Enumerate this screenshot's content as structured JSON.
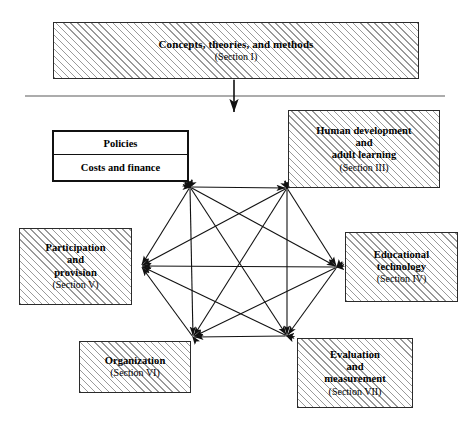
{
  "figure": {
    "type": "block-diagram"
  },
  "boxes": {
    "concepts": {
      "id": "concepts-theories-methods",
      "title": "Concepts, theories, and methods",
      "section": "(Section I)",
      "style": "hatched",
      "position": "top-banner"
    },
    "policies": {
      "id": "policies-costs-finance",
      "title": "Policies",
      "subtitle": "Costs and finance",
      "style": "plain-white",
      "position": "upper-left"
    },
    "human": {
      "id": "human-development-adult-learning",
      "line1": "Human development",
      "line2": "and",
      "line3": "adult learning",
      "section": "(Section III)",
      "style": "hatched",
      "position": "upper-right"
    },
    "participation": {
      "id": "participation-and-provision",
      "line1": "Participation",
      "line2": "and",
      "line3": "provision",
      "section": "(Section V)",
      "style": "hatched",
      "position": "left"
    },
    "edtech": {
      "id": "educational-technology",
      "line1": "Educational",
      "line2": "technology",
      "section": "(Section IV)",
      "style": "hatched",
      "position": "right"
    },
    "organization": {
      "id": "organization",
      "line1": "Organization",
      "section": "(Section VI)",
      "style": "hatched",
      "position": "bottom-left"
    },
    "evaluation": {
      "id": "evaluation-and-measurement",
      "line1": "Evaluation",
      "line2": "and",
      "line3": "measurement",
      "section": "(Section VII)",
      "style": "hatched",
      "position": "bottom-right"
    }
  },
  "divider": {
    "name": "horizontal-separator",
    "x1": 25,
    "y1": 96,
    "x2": 445,
    "y2": 96,
    "color": "#5a5a5a"
  },
  "vertical_connector": {
    "name": "bidirectional-vertical-arrow",
    "x": 234,
    "y_top": 79,
    "y_bottom": 113,
    "arrowheads": "both",
    "color": "#111111"
  },
  "network": {
    "name": "complete-graph-k6",
    "arrowheads": "both",
    "color": "#111111",
    "nodes": [
      {
        "id": "policies",
        "x": 190,
        "y": 187,
        "label": "Policies / Costs and finance"
      },
      {
        "id": "human",
        "x": 287,
        "y": 188,
        "label": "Human development and adult learning"
      },
      {
        "id": "edtech",
        "x": 337,
        "y": 267,
        "label": "Educational technology"
      },
      {
        "id": "evaluation",
        "x": 287,
        "y": 336,
        "label": "Evaluation and measurement"
      },
      {
        "id": "organization",
        "x": 193,
        "y": 337,
        "label": "Organization"
      },
      {
        "id": "participation",
        "x": 141,
        "y": 266,
        "label": "Participation and provision"
      }
    ],
    "edges": [
      [
        "policies",
        "human"
      ],
      [
        "policies",
        "edtech"
      ],
      [
        "policies",
        "evaluation"
      ],
      [
        "policies",
        "organization"
      ],
      [
        "policies",
        "participation"
      ],
      [
        "human",
        "edtech"
      ],
      [
        "human",
        "evaluation"
      ],
      [
        "human",
        "organization"
      ],
      [
        "human",
        "participation"
      ],
      [
        "edtech",
        "evaluation"
      ],
      [
        "edtech",
        "organization"
      ],
      [
        "edtech",
        "participation"
      ],
      [
        "evaluation",
        "organization"
      ],
      [
        "evaluation",
        "participation"
      ],
      [
        "organization",
        "participation"
      ]
    ]
  },
  "colors": {
    "ink": "#111111",
    "box_border": "#2b2b2b",
    "hatch": "#9a9a9a",
    "divider": "#5a5a5a",
    "background": "#ffffff"
  }
}
